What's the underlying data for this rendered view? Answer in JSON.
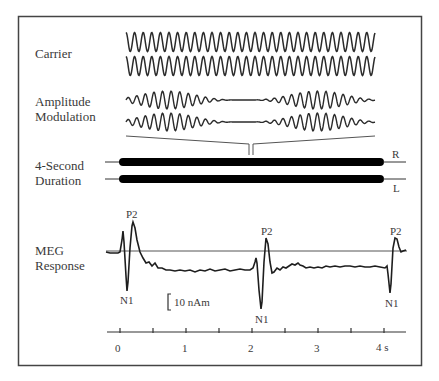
{
  "figure": {
    "rows": [
      {
        "id": "carrier",
        "label": "Carrier"
      },
      {
        "id": "am",
        "label_line1": "Amplitude",
        "label_line2": "Modulation"
      },
      {
        "id": "duration",
        "label_line1": "4-Second",
        "label_line2": "Duration"
      },
      {
        "id": "meg",
        "label_line1": "MEG",
        "label_line2": "Response"
      }
    ],
    "channels": {
      "right": "R",
      "left": "L"
    },
    "peaks": {
      "p2": "P2",
      "n1": "N1"
    },
    "scale_bar": "10 nAm",
    "axis": {
      "ticks": [
        "0",
        "1",
        "2",
        "3",
        "4 s"
      ],
      "tick_values": [
        0,
        0.5,
        1,
        1.5,
        2,
        2.5,
        3,
        3.5,
        4
      ],
      "unit": "s"
    },
    "colors": {
      "ink": "#2b2b2b",
      "frame": "#444444",
      "background": "#ffffff"
    }
  }
}
